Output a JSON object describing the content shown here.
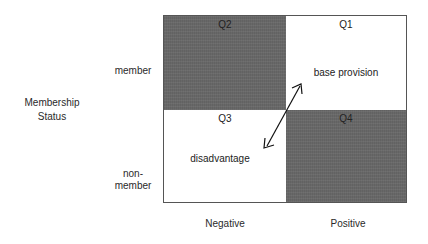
{
  "y_axis": {
    "title_line1": "Membership",
    "title_line2": "Status",
    "ticks": {
      "member": "member",
      "non_member_line1": "non-",
      "non_member_line2": "member"
    }
  },
  "x_axis": {
    "ticks": [
      "Negative",
      "Positive"
    ]
  },
  "quadrants": {
    "q1": {
      "title": "Q1",
      "text": "base provision",
      "fill": "#ffffff"
    },
    "q2": {
      "title": "Q2",
      "text": "",
      "fill": "#686868"
    },
    "q3": {
      "title": "Q3",
      "text": "disadvantage",
      "fill": "#ffffff"
    },
    "q4": {
      "title": "Q4",
      "text": "",
      "fill": "#686868"
    }
  },
  "arrow": {
    "type": "double-headed",
    "from": "Q3 disadvantage",
    "to": "Q1 base provision"
  }
}
